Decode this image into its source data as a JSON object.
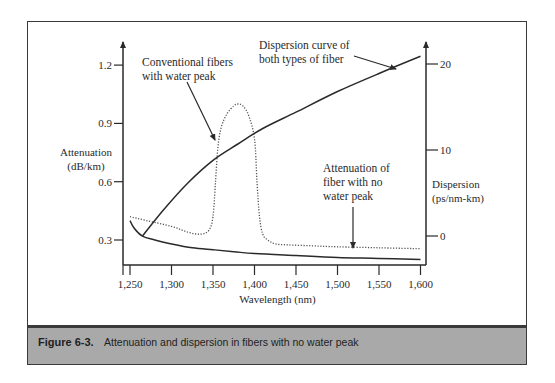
{
  "chart_data": {
    "type": "line",
    "title": "",
    "xlabel": "Wavelength (nm)",
    "ylabel": "Attenuation (dB/km)",
    "ylabel_lines": [
      "Attenuation",
      "(dB/km)"
    ],
    "y2label": "Dispersion (ps/nm-km)",
    "y2label_lines": [
      "Dispersion",
      "(ps/nm-km)"
    ],
    "xlim": [
      1245,
      1610
    ],
    "ylim": [
      0.17,
      1.35
    ],
    "y2lim": [
      -3,
      23
    ],
    "x_ticks": [
      1250,
      1300,
      1350,
      1400,
      1450,
      1500,
      1550,
      1600
    ],
    "x_tick_labels": [
      "1,250",
      "1,300",
      "1,350",
      "1,400",
      "1,450",
      "1,500",
      "1,550",
      "1,600"
    ],
    "y_ticks": [
      0.3,
      0.6,
      0.9,
      1.2
    ],
    "y_tick_labels": [
      "0.3",
      "0.6",
      "0.9",
      "1.2"
    ],
    "y2_ticks": [
      0,
      10,
      20
    ],
    "y2_tick_labels": [
      "0",
      "10",
      "20"
    ],
    "grid": false,
    "series": [
      {
        "name": "Attenuation of fiber with no water peak",
        "axis": "left",
        "style": "solid",
        "x": [
          1250,
          1255,
          1265,
          1280,
          1300,
          1325,
          1350,
          1375,
          1400,
          1450,
          1500,
          1550,
          1600
        ],
        "values": [
          0.4,
          0.36,
          0.32,
          0.3,
          0.28,
          0.26,
          0.25,
          0.24,
          0.23,
          0.22,
          0.21,
          0.205,
          0.2
        ]
      },
      {
        "name": "Conventional fibers with water peak",
        "axis": "left",
        "style": "dotted",
        "x": [
          1250,
          1270,
          1300,
          1320,
          1335,
          1345,
          1350,
          1353,
          1356,
          1360,
          1367,
          1375,
          1380,
          1386,
          1393,
          1400,
          1403,
          1406,
          1410,
          1416,
          1425,
          1440,
          1470,
          1500,
          1550,
          1600
        ],
        "values": [
          0.42,
          0.4,
          0.37,
          0.34,
          0.33,
          0.35,
          0.42,
          0.6,
          0.78,
          0.88,
          0.95,
          0.99,
          1.0,
          0.99,
          0.94,
          0.82,
          0.6,
          0.42,
          0.33,
          0.3,
          0.28,
          0.275,
          0.27,
          0.265,
          0.26,
          0.255
        ]
      },
      {
        "name": "Dispersion curve of both types of fiber",
        "axis": "right",
        "style": "solid",
        "x": [
          1265,
          1290,
          1320,
          1350,
          1380,
          1410,
          1450,
          1500,
          1550,
          1600
        ],
        "values": [
          0.0,
          3.0,
          6.2,
          8.8,
          10.7,
          12.5,
          14.4,
          16.8,
          18.9,
          20.9
        ]
      }
    ],
    "annotations": [
      {
        "id": "conv",
        "lines": [
          "Conventional fibers",
          "with water peak"
        ]
      },
      {
        "id": "disp",
        "lines": [
          "Dispersion curve of",
          "both types of fiber"
        ]
      },
      {
        "id": "nopeak",
        "lines": [
          "Attenuation of",
          "fiber with no",
          "water peak"
        ]
      }
    ]
  },
  "caption": {
    "figure_number": "Figure 6-3.",
    "text": "Attenuation and dispersion in fibers with no water peak"
  }
}
